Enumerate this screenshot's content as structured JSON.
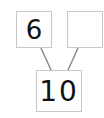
{
  "diagram": {
    "type": "number-bond",
    "parts": [
      {
        "label": "6"
      },
      {
        "label": ""
      }
    ],
    "whole": {
      "label": "10"
    },
    "colors": {
      "box_border": "#c8c8c8",
      "line": "#8a8a8a",
      "text": "#111111"
    }
  }
}
